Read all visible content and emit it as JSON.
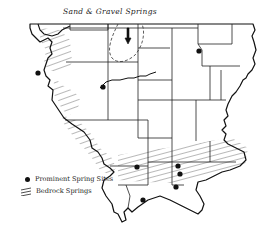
{
  "map": {
    "title": "Sand & Gravel Springs",
    "region": "Illinois county outline map",
    "colors": {
      "ink": "#111111",
      "background": "#ffffff"
    },
    "legend": {
      "items": [
        {
          "symbol": "filled-dot",
          "label": "Prominent Spring Sites"
        },
        {
          "symbol": "diagonal-hatch",
          "label": "Bedrock Springs"
        }
      ]
    },
    "features": {
      "sand_gravel_area": {
        "label": "Sand & Gravel Springs",
        "style": "dashed-outline"
      },
      "spring_sites": [
        {
          "x": 38,
          "y": 73
        },
        {
          "x": 103,
          "y": 87
        },
        {
          "x": 199,
          "y": 51
        },
        {
          "x": 137,
          "y": 167
        },
        {
          "x": 178,
          "y": 166
        },
        {
          "x": 180,
          "y": 174
        },
        {
          "x": 176,
          "y": 187
        },
        {
          "x": 143,
          "y": 200
        }
      ],
      "bedrock_zones": [
        "western-river-bluffs",
        "southern-band"
      ]
    }
  }
}
